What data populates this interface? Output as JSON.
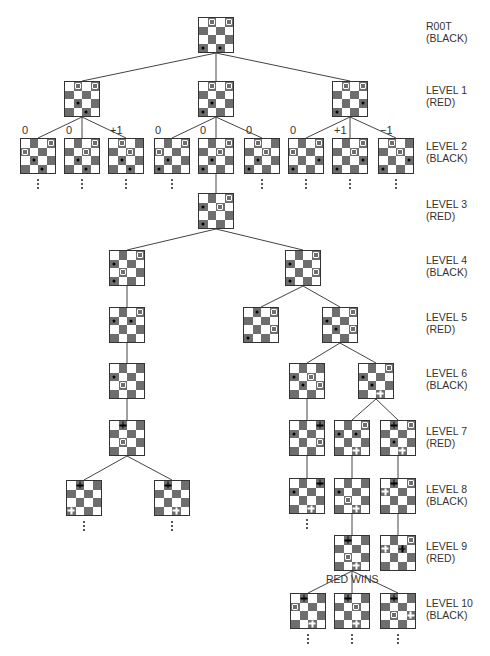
{
  "colors": {
    "dark_square": "#6e6e6e",
    "light_square": "#ffffff",
    "line": "#444444",
    "text": "#333333"
  },
  "levels": [
    {
      "name": "R00T",
      "side": "(BLACK)",
      "y": 20
    },
    {
      "name": "LEVEL 1",
      "side": "(RED)",
      "y": 84
    },
    {
      "name": "LEVEL 2",
      "side": "(BLACK)",
      "y": 140
    },
    {
      "name": "LEVEL 3",
      "side": "(RED)",
      "y": 198
    },
    {
      "name": "LEVEL 4",
      "side": "(BLACK)",
      "y": 254
    },
    {
      "name": "LEVEL 5",
      "side": "(RED)",
      "y": 311
    },
    {
      "name": "LEVEL 6",
      "side": "(BLACK)",
      "y": 367
    },
    {
      "name": "LEVEL 7",
      "side": "(RED)",
      "y": 425
    },
    {
      "name": "LEVEL 8",
      "side": "(BLACK)",
      "y": 483
    },
    {
      "name": "LEVEL 9",
      "side": "(RED)",
      "y": 540
    },
    {
      "name": "LEVEL 10",
      "side": "(BLACK)",
      "y": 597
    }
  ],
  "scores": [
    {
      "text": "0",
      "x": 22,
      "y": 124
    },
    {
      "text": "0",
      "x": 66,
      "y": 124
    },
    {
      "text": "+1",
      "x": 110,
      "y": 124
    },
    {
      "text": "0",
      "x": 155,
      "y": 124
    },
    {
      "text": "0",
      "x": 200,
      "y": 124
    },
    {
      "text": "0",
      "x": 246,
      "y": 124
    },
    {
      "text": "0",
      "x": 290,
      "y": 124
    },
    {
      "text": "+1",
      "x": 334,
      "y": 124
    },
    {
      "text": "−1",
      "x": 380,
      "y": 124
    }
  ],
  "annotations": {
    "red_wins": "RED WINS"
  },
  "boards": [
    {
      "id": "root",
      "x": 198,
      "y": 17,
      "pieces": [
        [
          0,
          1,
          "r"
        ],
        [
          0,
          3,
          "r"
        ],
        [
          3,
          0,
          "b"
        ],
        [
          3,
          2,
          "b"
        ]
      ]
    },
    {
      "id": "l1a",
      "x": 64,
      "y": 81,
      "pieces": [
        [
          0,
          1,
          "r"
        ],
        [
          0,
          3,
          "r"
        ],
        [
          2,
          1,
          "b"
        ],
        [
          3,
          2,
          "b"
        ]
      ]
    },
    {
      "id": "l1b",
      "x": 198,
      "y": 81,
      "pieces": [
        [
          0,
          1,
          "r"
        ],
        [
          0,
          3,
          "r"
        ],
        [
          2,
          1,
          "b"
        ],
        [
          3,
          0,
          "b"
        ]
      ]
    },
    {
      "id": "l1c",
      "x": 332,
      "y": 81,
      "pieces": [
        [
          0,
          1,
          "r"
        ],
        [
          0,
          3,
          "r"
        ],
        [
          2,
          3,
          "b"
        ],
        [
          3,
          0,
          "b"
        ]
      ]
    },
    {
      "id": "l2a",
      "x": 20,
      "y": 138,
      "pieces": [
        [
          0,
          3,
          "r"
        ],
        [
          1,
          0,
          "r"
        ],
        [
          2,
          1,
          "b"
        ],
        [
          3,
          2,
          "b"
        ]
      ]
    },
    {
      "id": "l2b",
      "x": 64,
      "y": 138,
      "pieces": [
        [
          0,
          3,
          "r"
        ],
        [
          1,
          2,
          "r"
        ],
        [
          2,
          1,
          "b"
        ],
        [
          3,
          2,
          "b"
        ]
      ]
    },
    {
      "id": "l2c",
      "x": 108,
      "y": 138,
      "pieces": [
        [
          0,
          1,
          "r"
        ],
        [
          1,
          2,
          "r"
        ],
        [
          2,
          1,
          "b"
        ],
        [
          3,
          2,
          "b"
        ]
      ]
    },
    {
      "id": "l2d",
      "x": 154,
      "y": 138,
      "pieces": [
        [
          0,
          3,
          "r"
        ],
        [
          1,
          0,
          "r"
        ],
        [
          2,
          1,
          "b"
        ],
        [
          3,
          0,
          "b"
        ]
      ]
    },
    {
      "id": "l2e",
      "x": 198,
      "y": 138,
      "pieces": [
        [
          0,
          3,
          "r"
        ],
        [
          1,
          2,
          "r"
        ],
        [
          2,
          1,
          "b"
        ],
        [
          3,
          0,
          "b"
        ]
      ]
    },
    {
      "id": "l2f",
      "x": 244,
      "y": 138,
      "pieces": [
        [
          0,
          1,
          "r"
        ],
        [
          1,
          2,
          "r"
        ],
        [
          2,
          1,
          "b"
        ],
        [
          3,
          0,
          "b"
        ]
      ]
    },
    {
      "id": "l2g",
      "x": 288,
      "y": 138,
      "pieces": [
        [
          0,
          3,
          "r"
        ],
        [
          1,
          0,
          "r"
        ],
        [
          2,
          3,
          "b"
        ],
        [
          3,
          0,
          "b"
        ]
      ]
    },
    {
      "id": "l2h",
      "x": 332,
      "y": 138,
      "pieces": [
        [
          0,
          3,
          "r"
        ],
        [
          1,
          2,
          "r"
        ],
        [
          2,
          3,
          "b"
        ],
        [
          3,
          0,
          "b"
        ]
      ]
    },
    {
      "id": "l2i",
      "x": 378,
      "y": 138,
      "pieces": [
        [
          0,
          1,
          "r"
        ],
        [
          1,
          2,
          "r"
        ],
        [
          2,
          3,
          "b"
        ],
        [
          3,
          0,
          "b"
        ]
      ]
    },
    {
      "id": "l3",
      "x": 198,
      "y": 193,
      "pieces": [
        [
          0,
          3,
          "r"
        ],
        [
          1,
          2,
          "r"
        ],
        [
          1,
          0,
          "b"
        ],
        [
          3,
          0,
          "b"
        ]
      ]
    },
    {
      "id": "l4a",
      "x": 109,
      "y": 250,
      "pieces": [
        [
          0,
          3,
          "r"
        ],
        [
          2,
          1,
          "r"
        ],
        [
          1,
          0,
          "b"
        ],
        [
          3,
          0,
          "b"
        ]
      ]
    },
    {
      "id": "l4b",
      "x": 285,
      "y": 250,
      "pieces": [
        [
          0,
          3,
          "r"
        ],
        [
          2,
          3,
          "r"
        ],
        [
          1,
          0,
          "b"
        ],
        [
          3,
          0,
          "b"
        ]
      ]
    },
    {
      "id": "l5a",
      "x": 109,
      "y": 307,
      "pieces": [
        [
          0,
          3,
          "r"
        ],
        [
          1,
          0,
          "b"
        ],
        [
          1,
          2,
          "b"
        ]
      ]
    },
    {
      "id": "l5b",
      "x": 243,
      "y": 307,
      "pieces": [
        [
          0,
          3,
          "r"
        ],
        [
          2,
          3,
          "r"
        ],
        [
          0,
          1,
          "b"
        ],
        [
          3,
          0,
          "b"
        ]
      ]
    },
    {
      "id": "l5c",
      "x": 322,
      "y": 307,
      "pieces": [
        [
          0,
          3,
          "r"
        ],
        [
          2,
          3,
          "r"
        ],
        [
          1,
          0,
          "b"
        ],
        [
          2,
          1,
          "b"
        ]
      ]
    },
    {
      "id": "l6a",
      "x": 109,
      "y": 363,
      "pieces": [
        [
          1,
          0,
          "b"
        ],
        [
          2,
          1,
          "r"
        ]
      ]
    },
    {
      "id": "l6b",
      "x": 289,
      "y": 363,
      "pieces": [
        [
          1,
          2,
          "r"
        ],
        [
          2,
          3,
          "r"
        ],
        [
          1,
          0,
          "b"
        ],
        [
          2,
          1,
          "b"
        ]
      ]
    },
    {
      "id": "l6c",
      "x": 358,
      "y": 363,
      "pieces": [
        [
          0,
          3,
          "r"
        ],
        [
          3,
          2,
          "rk"
        ],
        [
          1,
          0,
          "b"
        ],
        [
          2,
          1,
          "b"
        ]
      ]
    },
    {
      "id": "l7a",
      "x": 109,
      "y": 420,
      "pieces": [
        [
          0,
          1,
          "bk"
        ],
        [
          2,
          1,
          "r"
        ]
      ]
    },
    {
      "id": "l7b",
      "x": 289,
      "y": 420,
      "pieces": [
        [
          0,
          3,
          "bk"
        ],
        [
          1,
          0,
          "b"
        ],
        [
          2,
          3,
          "r"
        ]
      ]
    },
    {
      "id": "l7c",
      "x": 334,
      "y": 420,
      "pieces": [
        [
          0,
          3,
          "r"
        ],
        [
          1,
          0,
          "b"
        ],
        [
          1,
          2,
          "b"
        ],
        [
          3,
          2,
          "rk"
        ]
      ]
    },
    {
      "id": "l7d",
      "x": 380,
      "y": 420,
      "pieces": [
        [
          0,
          1,
          "bk"
        ],
        [
          0,
          3,
          "r"
        ],
        [
          2,
          1,
          "b"
        ],
        [
          3,
          2,
          "rk"
        ]
      ]
    },
    {
      "id": "l8a",
      "x": 66,
      "y": 480,
      "pieces": [
        [
          0,
          1,
          "bk"
        ],
        [
          3,
          0,
          "rk"
        ]
      ]
    },
    {
      "id": "l8b",
      "x": 154,
      "y": 480,
      "pieces": [
        [
          0,
          1,
          "bk"
        ],
        [
          3,
          2,
          "rk"
        ]
      ]
    },
    {
      "id": "l8c",
      "x": 289,
      "y": 478,
      "pieces": [
        [
          0,
          3,
          "bk"
        ],
        [
          1,
          0,
          "b"
        ],
        [
          3,
          2,
          "rk"
        ]
      ]
    },
    {
      "id": "l8d",
      "x": 334,
      "y": 478,
      "pieces": [
        [
          1,
          0,
          "b"
        ],
        [
          2,
          1,
          "r"
        ],
        [
          3,
          2,
          "rk"
        ]
      ]
    },
    {
      "id": "l8e",
      "x": 380,
      "y": 478,
      "pieces": [
        [
          0,
          1,
          "bk"
        ],
        [
          0,
          3,
          "r"
        ],
        [
          1,
          0,
          "rk"
        ]
      ]
    },
    {
      "id": "l9a",
      "x": 334,
      "y": 535,
      "pieces": [
        [
          0,
          1,
          "bk"
        ],
        [
          2,
          1,
          "r"
        ],
        [
          3,
          2,
          "rk"
        ]
      ]
    },
    {
      "id": "l9b",
      "x": 380,
      "y": 535,
      "pieces": [
        [
          0,
          3,
          "r"
        ],
        [
          1,
          0,
          "rk"
        ],
        [
          1,
          2,
          "bk"
        ]
      ]
    },
    {
      "id": "l10a",
      "x": 290,
      "y": 593,
      "pieces": [
        [
          0,
          1,
          "bk"
        ],
        [
          1,
          0,
          "r"
        ],
        [
          3,
          2,
          "rk"
        ]
      ]
    },
    {
      "id": "l10b",
      "x": 334,
      "y": 593,
      "pieces": [
        [
          0,
          1,
          "bk"
        ],
        [
          1,
          2,
          "r"
        ],
        [
          3,
          2,
          "rk"
        ]
      ]
    },
    {
      "id": "l10c",
      "x": 380,
      "y": 593,
      "pieces": [
        [
          0,
          1,
          "bk"
        ],
        [
          2,
          1,
          "r"
        ],
        [
          2,
          3,
          "rk"
        ]
      ]
    }
  ],
  "edges": [
    [
      "root",
      "l1a"
    ],
    [
      "root",
      "l1b"
    ],
    [
      "root",
      "l1c"
    ],
    [
      "l1a",
      "l2a"
    ],
    [
      "l1a",
      "l2b"
    ],
    [
      "l1a",
      "l2c"
    ],
    [
      "l1b",
      "l2d"
    ],
    [
      "l1b",
      "l2e"
    ],
    [
      "l1b",
      "l2f"
    ],
    [
      "l1c",
      "l2g"
    ],
    [
      "l1c",
      "l2h"
    ],
    [
      "l1c",
      "l2i"
    ],
    [
      "l2e",
      "l3"
    ],
    [
      "l3",
      "l4a"
    ],
    [
      "l3",
      "l4b"
    ],
    [
      "l4a",
      "l5a"
    ],
    [
      "l4b",
      "l5b"
    ],
    [
      "l4b",
      "l5c"
    ],
    [
      "l5a",
      "l6a"
    ],
    [
      "l5c",
      "l6b"
    ],
    [
      "l5c",
      "l6c"
    ],
    [
      "l6a",
      "l7a"
    ],
    [
      "l6b",
      "l7b"
    ],
    [
      "l6c",
      "l7c"
    ],
    [
      "l6c",
      "l7d"
    ],
    [
      "l7a",
      "l8a"
    ],
    [
      "l7a",
      "l8b"
    ],
    [
      "l7b",
      "l8c"
    ],
    [
      "l7c",
      "l8d"
    ],
    [
      "l7d",
      "l8e"
    ],
    [
      "l8d",
      "l9a"
    ],
    [
      "l8e",
      "l9b"
    ],
    [
      "l9a",
      "l10a"
    ],
    [
      "l9a",
      "l10b"
    ],
    [
      "l9a",
      "l10c"
    ]
  ],
  "continuations": [
    "l2a",
    "l2b",
    "l2c",
    "l2d",
    "l2f",
    "l2g",
    "l2h",
    "l2i",
    "l8a",
    "l8b",
    "l8c",
    "l10a",
    "l10b",
    "l10c"
  ]
}
